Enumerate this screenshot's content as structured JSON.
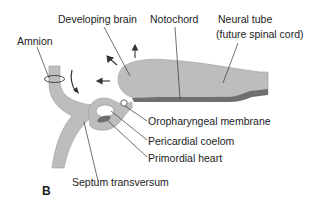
{
  "figure": {
    "panel_label": "B",
    "labels": {
      "developing_brain": "Developing brain",
      "notochord": "Notochord",
      "neural_tube_line1": "Neural tube",
      "neural_tube_line2": "(future spinal cord)",
      "amnion": "Amnion",
      "oropharyngeal_membrane": "Oropharyngeal membrane",
      "pericardial_coelom": "Pericardial coelom",
      "primordial_heart": "Primordial heart",
      "septum_transversum": "Septum transversum"
    },
    "colors": {
      "tissue_light": "#bdbdbd",
      "tissue_dark": "#7a7a7a",
      "outline": "#555555",
      "leader": "#333333"
    }
  }
}
